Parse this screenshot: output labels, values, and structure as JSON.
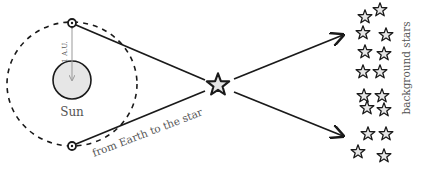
{
  "diagram": {
    "labels": {
      "sun": "Sun",
      "distance": "1 A.U.",
      "sightline": "from Earth to the star",
      "background": "background stars"
    },
    "colors": {
      "line": "#1a1a1a",
      "fill": "#e6e6e6",
      "label": "#555555",
      "distance_arrow": "#999999"
    },
    "sun": {
      "cx": 72,
      "cy": 80,
      "r": 19
    },
    "orbit": {
      "cx": 72,
      "cy": 84,
      "rx": 65,
      "ry": 62
    },
    "earth_positions": [
      {
        "x": 72,
        "y": 23
      },
      {
        "x": 72,
        "y": 146
      }
    ],
    "near_star": {
      "x": 218,
      "y": 85,
      "r": 12
    },
    "background_stars": [
      {
        "x": 380,
        "y": 10
      },
      {
        "x": 365,
        "y": 17
      },
      {
        "x": 363,
        "y": 33
      },
      {
        "x": 386,
        "y": 35
      },
      {
        "x": 365,
        "y": 52
      },
      {
        "x": 384,
        "y": 54
      },
      {
        "x": 363,
        "y": 72
      },
      {
        "x": 380,
        "y": 72
      },
      {
        "x": 364,
        "y": 96
      },
      {
        "x": 382,
        "y": 96
      },
      {
        "x": 367,
        "y": 108
      },
      {
        "x": 384,
        "y": 110
      },
      {
        "x": 368,
        "y": 134
      },
      {
        "x": 386,
        "y": 134
      },
      {
        "x": 358,
        "y": 152
      },
      {
        "x": 384,
        "y": 156
      }
    ]
  }
}
